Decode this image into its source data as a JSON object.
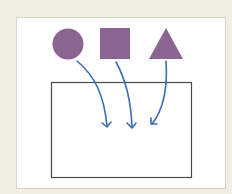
{
  "diagram": {
    "colors": {
      "background": "#f2eee3",
      "panel": "#ffffff",
      "panel_border": "#d6d3cb",
      "shape_fill": "#8a6592",
      "arrow": "#3b6db3",
      "container_stroke": "#4a4a4a"
    },
    "shapes": [
      {
        "type": "circle",
        "name": "circle"
      },
      {
        "type": "square",
        "name": "square"
      },
      {
        "type": "triangle",
        "name": "triangle"
      }
    ],
    "arrows": [
      {
        "from": "circle",
        "to": "container"
      },
      {
        "from": "square",
        "to": "container"
      },
      {
        "from": "triangle",
        "to": "container"
      }
    ],
    "container": {
      "type": "rectangle",
      "name": "container"
    }
  }
}
